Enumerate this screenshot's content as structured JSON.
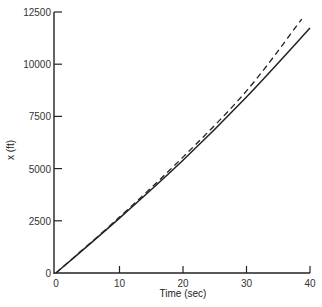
{
  "chart_data": {
    "type": "line",
    "title": "",
    "xlabel": "Time (sec)",
    "ylabel": "x (ft)",
    "xlim": [
      0,
      40
    ],
    "ylim": [
      0,
      12500
    ],
    "x_ticks": [
      0,
      10,
      20,
      30,
      40
    ],
    "y_ticks": [
      0,
      2500,
      5000,
      7500,
      10000,
      12500
    ],
    "grid": false,
    "legend": null,
    "series": [
      {
        "name": "solid",
        "style": "solid",
        "x": [
          0,
          10,
          20,
          30,
          40
        ],
        "y": [
          0,
          2630,
          5400,
          8430,
          11730
        ]
      },
      {
        "name": "dashed",
        "style": "dashed",
        "x": [
          0,
          10,
          20,
          30,
          38.7
        ],
        "y": [
          0,
          2680,
          5550,
          8720,
          12160
        ]
      }
    ]
  },
  "axes": {
    "xlabel": "Time (sec)",
    "ylabel": "x (ft)",
    "x_tick_labels": [
      "0",
      "10",
      "20",
      "30",
      "40"
    ],
    "y_tick_labels": [
      "0",
      "2500",
      "5000",
      "7500",
      "10000",
      "12500"
    ]
  }
}
